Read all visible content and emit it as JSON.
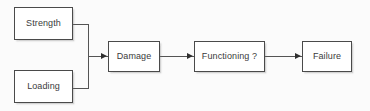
{
  "diagram": {
    "background_color": "#fbfbfb",
    "box_fill_color": "#ffffff",
    "box_border_color": "#4a4a4a",
    "line_color": "#545454",
    "arrow_color": "#303030",
    "text_color": "#3b3b3b",
    "nodes": [
      {
        "id": "strength",
        "label": "Strength",
        "x": 14,
        "y": 7,
        "w": 59,
        "h": 33
      },
      {
        "id": "loading",
        "label": "Loading",
        "x": 14,
        "y": 70,
        "w": 59,
        "h": 33
      },
      {
        "id": "damage",
        "label": "Damage",
        "x": 108,
        "y": 41,
        "w": 52,
        "h": 31
      },
      {
        "id": "functioning",
        "label": "Functioning ?",
        "x": 194,
        "y": 41,
        "w": 71,
        "h": 31
      },
      {
        "id": "failure",
        "label": "Failure",
        "x": 302,
        "y": 41,
        "w": 50,
        "h": 31
      }
    ],
    "edges": [
      {
        "id": "strength-to-junction",
        "from": "strength",
        "to": "junction",
        "arrow": false
      },
      {
        "id": "loading-to-junction",
        "from": "loading",
        "to": "junction",
        "arrow": false
      },
      {
        "id": "junction-to-damage",
        "from": "junction",
        "to": "damage",
        "arrow": true
      },
      {
        "id": "damage-to-functioning",
        "from": "damage",
        "to": "functioning",
        "arrow": true
      },
      {
        "id": "functioning-to-failure",
        "from": "functioning",
        "to": "failure",
        "arrow": true
      }
    ]
  }
}
